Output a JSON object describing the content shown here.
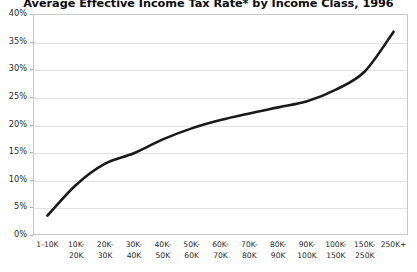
{
  "chart_data": {
    "type": "line",
    "title": "Average Effective Income Tax Rate* by Income Class, 1996",
    "xlabel": "",
    "ylabel": "",
    "ylim": [
      0,
      40
    ],
    "yticks": [
      0,
      5,
      10,
      15,
      20,
      25,
      30,
      35,
      40
    ],
    "ytick_labels": [
      "0%",
      "5%",
      "10%",
      "15%",
      "20%",
      "25%",
      "30%",
      "35%",
      "40%"
    ],
    "grid": true,
    "legend": "none",
    "line_color": "#1a1a1a",
    "line_width": 2.6,
    "categories": [
      "1-10K",
      "10K-20K",
      "20K-30K",
      "30K-40K",
      "40K-50K",
      "50K-60K",
      "60K-70K",
      "70K-80K",
      "80K-90K",
      "90K-100K",
      "100K-150K",
      "150K-250K",
      "250K+"
    ],
    "category_lines": [
      [
        "1-10K"
      ],
      [
        "10K-",
        "20K"
      ],
      [
        "20K-",
        "30K"
      ],
      [
        "30K-",
        "40K"
      ],
      [
        "40K-",
        "50K"
      ],
      [
        "50K-",
        "60K"
      ],
      [
        "60K-",
        "70K"
      ],
      [
        "70K-",
        "80K"
      ],
      [
        "80K-",
        "90K"
      ],
      [
        "90K-",
        "100K"
      ],
      [
        "100K-",
        "150K"
      ],
      [
        "150K-",
        "250K"
      ],
      [
        "250K+"
      ]
    ],
    "values": [
      3.5,
      9.1,
      12.9,
      14.8,
      17.3,
      19.3,
      20.8,
      22.0,
      23.1,
      24.2,
      26.3,
      29.6,
      36.8
    ],
    "series": [
      {
        "name": "Average Effective Income Tax Rate",
        "values": [
          3.5,
          9.1,
          12.9,
          14.8,
          17.3,
          19.3,
          20.8,
          22.0,
          23.1,
          24.2,
          26.3,
          29.6,
          36.8
        ]
      }
    ]
  },
  "footnote": "*"
}
